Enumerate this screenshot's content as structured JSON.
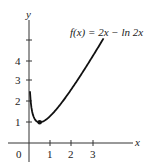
{
  "chart_data": {
    "type": "line",
    "title": "",
    "function_label": "f(x) = 2x − ln 2x",
    "xlabel": "x",
    "ylabel": "y",
    "origin_label": "0",
    "x_ticks": [
      "1",
      "2",
      "3"
    ],
    "y_ticks": [
      "1",
      "2",
      "3",
      "4"
    ],
    "xlim": [
      -0.9,
      4.0
    ],
    "ylim": [
      -0.4,
      5.8
    ],
    "grid": false,
    "legend": "none",
    "series": [
      {
        "name": "f(x) = 2x − ln 2x",
        "x": [
          0.05,
          0.1,
          0.2,
          0.3,
          0.4,
          0.5,
          0.75,
          1.0,
          1.5,
          2.0,
          2.5,
          3.0,
          3.5
        ],
        "y": [
          2.4,
          1.81,
          1.32,
          1.09,
          0.98,
          1.0,
          1.09,
          1.31,
          1.9,
          2.61,
          3.39,
          4.21,
          5.05
        ]
      }
    ],
    "annotations": [
      {
        "type": "point",
        "x": 0.5,
        "y": 1.0,
        "label": "minimum"
      }
    ],
    "colors": {
      "curve": "#111111",
      "axis": "#333333"
    }
  }
}
